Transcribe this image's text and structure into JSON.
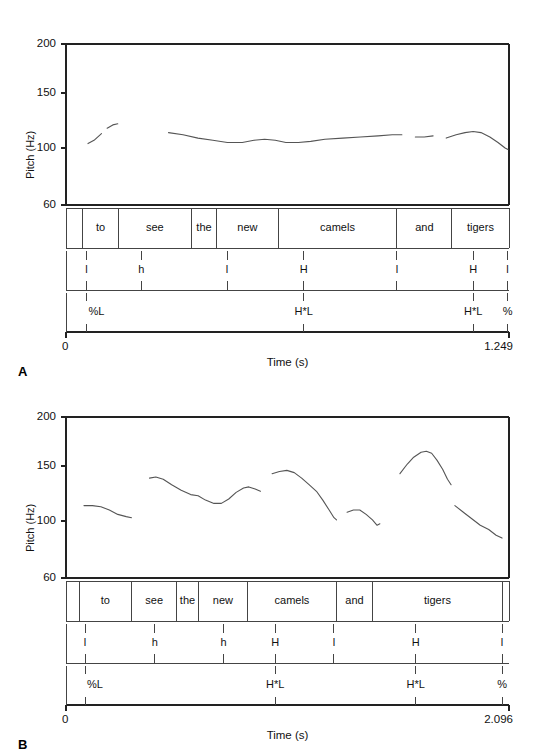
{
  "figure": {
    "panels": [
      {
        "letter": "A",
        "axis": {
          "ylabel": "Pitch (Hz)",
          "yticks": [
            200,
            150,
            100,
            60
          ],
          "ytick_labels": [
            "200",
            "150",
            "100",
            "60"
          ],
          "ylim": [
            60,
            200
          ],
          "xlabel": "Time (s)",
          "xtick_labels": [
            "0",
            "1.249"
          ],
          "xlim": [
            0,
            1.249
          ],
          "duration": 1.249
        },
        "words": [
          {
            "label": "to",
            "start": 0.047,
            "end": 0.148
          },
          {
            "label": "see",
            "start": 0.148,
            "end": 0.353
          },
          {
            "label": "the",
            "start": 0.353,
            "end": 0.425
          },
          {
            "label": "new",
            "start": 0.425,
            "end": 0.598
          },
          {
            "label": "camels",
            "start": 0.598,
            "end": 0.933
          },
          {
            "label": "and",
            "start": 0.933,
            "end": 1.088
          },
          {
            "label": "tigers",
            "start": 1.088,
            "end": 1.249
          }
        ],
        "tone_levels": [
          {
            "label": "l",
            "time": 0.058
          },
          {
            "label": "h",
            "time": 0.212
          },
          {
            "label": "l",
            "time": 0.454
          },
          {
            "label": "H",
            "time": 0.67
          },
          {
            "label": "l",
            "time": 0.933
          },
          {
            "label": "H",
            "time": 1.148
          },
          {
            "label": "l",
            "time": 1.245
          }
        ],
        "tone_marks": [
          {
            "label": "%L",
            "time": 0.058,
            "align": "right"
          },
          {
            "label": "H*L",
            "time": 0.67,
            "align": "center"
          },
          {
            "label": "H*L",
            "time": 1.148,
            "align": "center"
          },
          {
            "label": "%",
            "time": 1.245,
            "align": "center"
          }
        ],
        "contour": [
          {
            "points": [
              [
                0.062,
                104
              ],
              [
                0.079,
                107
              ],
              [
                0.093,
                111
              ],
              [
                0.1,
                113
              ]
            ]
          },
          {
            "points": [
              [
                0.116,
                118
              ],
              [
                0.132,
                121
              ],
              [
                0.146,
                122
              ]
            ]
          },
          {
            "points": [
              [
                0.289,
                114
              ],
              [
                0.33,
                112
              ],
              [
                0.372,
                109
              ],
              [
                0.414,
                107
              ],
              [
                0.455,
                105
              ],
              [
                0.497,
                105
              ],
              [
                0.53,
                107
              ],
              [
                0.56,
                108
              ],
              [
                0.59,
                107
              ],
              [
                0.62,
                105
              ],
              [
                0.655,
                105
              ],
              [
                0.69,
                106
              ],
              [
                0.73,
                108
              ],
              [
                0.78,
                109
              ],
              [
                0.83,
                110
              ],
              [
                0.88,
                111
              ],
              [
                0.92,
                112
              ],
              [
                0.947,
                112
              ]
            ]
          },
          {
            "points": [
              [
                0.985,
                110
              ],
              [
                1.01,
                110
              ],
              [
                1.035,
                111
              ]
            ]
          },
          {
            "points": [
              [
                1.072,
                109
              ],
              [
                1.1,
                112
              ],
              [
                1.125,
                114
              ],
              [
                1.148,
                115
              ],
              [
                1.17,
                114
              ],
              [
                1.195,
                110
              ],
              [
                1.218,
                105
              ],
              [
                1.238,
                100
              ],
              [
                1.246,
                99
              ]
            ]
          }
        ]
      },
      {
        "letter": "B",
        "axis": {
          "ylabel": "Pitch (Hz)",
          "yticks": [
            200,
            150,
            100,
            60
          ],
          "ytick_labels": [
            "200",
            "150",
            "100",
            "60"
          ],
          "ylim": [
            60,
            200
          ],
          "xlabel": "Time (s)",
          "xtick_labels": [
            "0",
            "2.096"
          ],
          "xlim": [
            0,
            2.096
          ],
          "duration": 2.096
        },
        "words": [
          {
            "label": "to",
            "start": 0.062,
            "end": 0.31
          },
          {
            "label": "see",
            "start": 0.31,
            "end": 0.525
          },
          {
            "label": "the",
            "start": 0.525,
            "end": 0.625
          },
          {
            "label": "new",
            "start": 0.625,
            "end": 0.86
          },
          {
            "label": "camels",
            "start": 0.86,
            "end": 1.278
          },
          {
            "label": "and",
            "start": 1.278,
            "end": 1.452
          },
          {
            "label": "tigers",
            "start": 1.452,
            "end": 2.063
          }
        ],
        "tone_levels": [
          {
            "label": "l",
            "time": 0.09
          },
          {
            "label": "h",
            "time": 0.42
          },
          {
            "label": "h",
            "time": 0.745
          },
          {
            "label": "H",
            "time": 0.99
          },
          {
            "label": "l",
            "time": 1.268
          },
          {
            "label": "H",
            "time": 1.655
          },
          {
            "label": "l",
            "time": 2.063
          }
        ],
        "tone_marks": [
          {
            "label": "%L",
            "time": 0.09,
            "align": "right"
          },
          {
            "label": "H*L",
            "time": 0.99,
            "align": "center"
          },
          {
            "label": "H*L",
            "time": 1.655,
            "align": "center"
          },
          {
            "label": "%",
            "time": 2.063,
            "align": "center"
          }
        ],
        "contour": [
          {
            "points": [
              [
                0.085,
                114
              ],
              [
                0.125,
                114
              ],
              [
                0.165,
                113
              ],
              [
                0.205,
                110
              ],
              [
                0.245,
                106
              ],
              [
                0.285,
                104
              ],
              [
                0.31,
                103
              ]
            ]
          },
          {
            "points": [
              [
                0.395,
                139
              ],
              [
                0.425,
                140
              ],
              [
                0.46,
                138
              ],
              [
                0.5,
                133
              ],
              [
                0.545,
                128
              ],
              [
                0.59,
                124
              ],
              [
                0.625,
                123
              ],
              [
                0.66,
                119
              ],
              [
                0.7,
                116
              ],
              [
                0.735,
                116
              ],
              [
                0.77,
                120
              ],
              [
                0.805,
                126
              ],
              [
                0.84,
                130
              ],
              [
                0.865,
                131
              ],
              [
                0.895,
                129
              ],
              [
                0.92,
                127
              ]
            ]
          },
          {
            "points": [
              [
                0.975,
                143
              ],
              [
                1.01,
                145
              ],
              [
                1.045,
                146
              ],
              [
                1.08,
                144
              ],
              [
                1.115,
                139
              ],
              [
                1.15,
                133
              ],
              [
                1.185,
                127
              ],
              [
                1.215,
                119
              ],
              [
                1.245,
                110
              ],
              [
                1.268,
                103
              ],
              [
                1.28,
                101
              ]
            ]
          },
          {
            "points": [
              [
                1.33,
                108
              ],
              [
                1.36,
                110
              ],
              [
                1.39,
                110
              ],
              [
                1.42,
                106
              ],
              [
                1.45,
                101
              ],
              [
                1.472,
                97
              ],
              [
                1.485,
                98
              ]
            ]
          },
          {
            "points": [
              [
                1.58,
                143
              ],
              [
                1.615,
                152
              ],
              [
                1.645,
                159
              ],
              [
                1.68,
                164
              ],
              [
                1.705,
                165
              ],
              [
                1.73,
                163
              ],
              [
                1.755,
                156
              ],
              [
                1.782,
                147
              ],
              [
                1.805,
                138
              ],
              [
                1.822,
                133
              ]
            ]
          },
          {
            "points": [
              [
                1.84,
                114
              ],
              [
                1.88,
                108
              ],
              [
                1.92,
                102
              ],
              [
                1.96,
                97
              ],
              [
                2.0,
                94
              ],
              [
                2.035,
                90
              ],
              [
                2.063,
                88
              ]
            ]
          }
        ]
      }
    ]
  },
  "style": {
    "line_color": "#555555",
    "axis_color": "#222222",
    "tier_border_color": "#444444",
    "text_color": "#111111"
  }
}
